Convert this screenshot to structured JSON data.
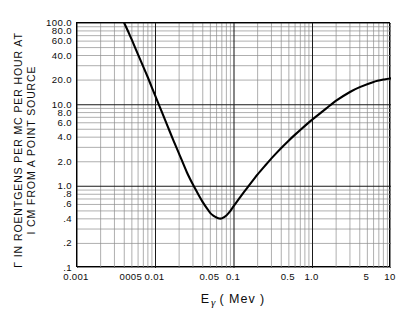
{
  "chart_data": {
    "type": "line",
    "title": "",
    "xlabel": "Eγ ( Mev )",
    "ylabel_line1": "Γ IN ROENTGENS PER MC PER HOUR AT",
    "ylabel_line2": "I CM FROM A POINT SOURCE",
    "xscale": "log",
    "yscale": "log",
    "xlim": [
      0.001,
      10
    ],
    "ylim": [
      0.1,
      100
    ],
    "grid": true,
    "legend": "none",
    "xticks": [
      0.001,
      0.005,
      0.01,
      0.05,
      0.1,
      0.5,
      1.0,
      5,
      10
    ],
    "xticklabels": [
      "0.001",
      "0005",
      "0.01",
      "0.05",
      "0.1",
      "0.5",
      "1.0",
      "5",
      "10"
    ],
    "yticks": [
      0.1,
      0.2,
      0.4,
      0.6,
      0.8,
      1.0,
      2.0,
      4.0,
      6.0,
      8.0,
      10.0,
      20.0,
      40.0,
      60.0,
      80.0,
      100.0
    ],
    "yticklabels": [
      ".1",
      ".2",
      ".4",
      ".6",
      ".8",
      "1.0",
      "2.0",
      "4.0",
      "6.0",
      "8.0",
      "10.0",
      "20.0",
      "40.0",
      "60.0",
      "80.0",
      "100.0"
    ],
    "series": [
      {
        "name": "gamma-ray dose rate constant",
        "color": "#000000",
        "linewidth": 2.1,
        "x": [
          0.004,
          0.0045,
          0.005,
          0.006,
          0.007,
          0.008,
          0.009,
          0.01,
          0.012,
          0.014,
          0.017,
          0.02,
          0.025,
          0.03,
          0.035,
          0.04,
          0.045,
          0.05,
          0.055,
          0.06,
          0.065,
          0.07,
          0.08,
          0.09,
          0.1,
          0.12,
          0.15,
          0.2,
          0.25,
          0.3,
          0.4,
          0.5,
          0.6,
          0.8,
          1.0,
          1.5,
          2.0,
          3.0,
          4.0,
          6.0,
          8.0,
          10.0
        ],
        "y": [
          100.0,
          78.0,
          62.0,
          41.0,
          29.0,
          21.5,
          16.2,
          12.6,
          8.2,
          5.7,
          3.6,
          2.5,
          1.5,
          1.05,
          0.8,
          0.64,
          0.54,
          0.47,
          0.435,
          0.415,
          0.403,
          0.405,
          0.44,
          0.5,
          0.58,
          0.74,
          0.98,
          1.4,
          1.8,
          2.2,
          2.95,
          3.65,
          4.3,
          5.5,
          6.6,
          9.0,
          11.2,
          14.3,
          16.4,
          19.0,
          20.3,
          21.0
        ],
        "minimum": {
          "x": 0.065,
          "y": 0.4
        },
        "endpoints": {
          "start": {
            "x": 0.004,
            "y": 100.0
          },
          "end": {
            "x": 10.0,
            "y": 21.0
          }
        }
      }
    ]
  },
  "axes": {
    "y_title_line1": "Γ IN ROENTGENS PER MC PER HOUR AT",
    "y_title_line2": "I CM FROM A POINT SOURCE",
    "x_title_main": "E",
    "x_title_sub": "γ",
    "x_title_unit": "( Mev )"
  }
}
